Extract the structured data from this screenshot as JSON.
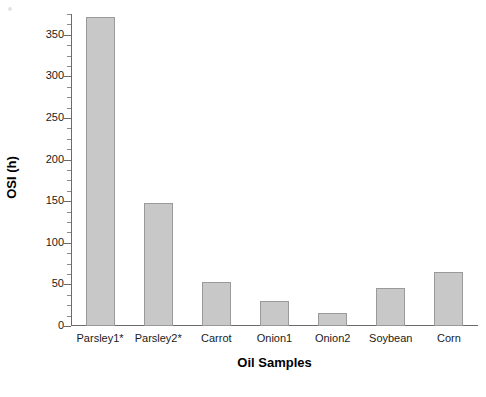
{
  "chart_data": {
    "type": "bar",
    "title": "",
    "categories": [
      "Parsley1*",
      "Parsley2*",
      "Carrot",
      "Onion1",
      "Onion2",
      "Soybean",
      "Corn"
    ],
    "values": [
      372,
      148,
      53,
      30,
      16,
      46,
      65
    ],
    "xlabel": "Oil Samples",
    "ylabel": "OSI (h)",
    "ylim": [
      0,
      375
    ],
    "ytick_labels": [
      "0",
      "50",
      "100",
      "150",
      "200",
      "250",
      "300",
      "350"
    ],
    "ytick_values": [
      0,
      50,
      100,
      150,
      200,
      250,
      300,
      350
    ],
    "minor_tick_step": 12.5,
    "grid": false,
    "legend": null,
    "bar_fill_color": "#c8c8c8",
    "bar_edge_color": "#9a9a9a",
    "axis_color": "#6b6b6b",
    "background_color": "#ffffff"
  }
}
